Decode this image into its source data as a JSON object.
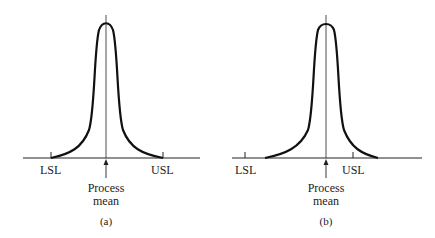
{
  "panels": [
    {
      "id": "a",
      "caption": "(a)",
      "lsl_label": "LSL",
      "usl_label": "USL",
      "mean_label_line1": "Process",
      "mean_label_line2": "mean",
      "curve_extent": "tails end exactly at LSL and USL",
      "mean_position": "centered between LSL and USL"
    },
    {
      "id": "b",
      "caption": "(b)",
      "lsl_label": "LSL",
      "usl_label": "USL",
      "mean_label_line1": "Process",
      "mean_label_line2": "mean",
      "curve_extent": "left tail inside LSL, right tail extends beyond USL",
      "mean_position": "shifted toward USL"
    }
  ],
  "colors": {
    "ink": "#111111",
    "background": "#ffffff"
  }
}
